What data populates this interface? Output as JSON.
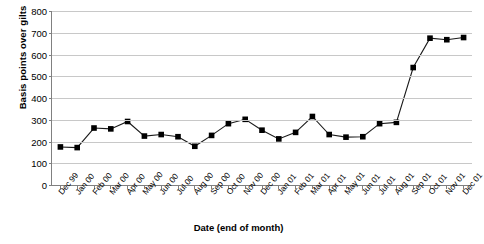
{
  "chart_data": {
    "type": "line",
    "title": "",
    "xlabel": "Date (end of month)",
    "ylabel": "Basis points over gilts",
    "ylim": [
      0,
      800
    ],
    "yticks": [
      0,
      100,
      200,
      300,
      400,
      500,
      600,
      700,
      800
    ],
    "grid": true,
    "legend": "none",
    "marker": "filled-square",
    "line_color": "#000000",
    "marker_color": "#000000",
    "gridline_color": "#c8c8c8",
    "axis_color": "#808080",
    "categories": [
      "Dec 99",
      "Jan 00",
      "Feb 00",
      "Mar 00",
      "Apr 00",
      "May 00",
      "Jun 00",
      "Jul 00",
      "Aug 00",
      "Sep 00",
      "Oct 00",
      "Nov 00",
      "Dec 00",
      "Jan 01",
      "Feb 01",
      "Mar 01",
      "Apr 01",
      "May 01",
      "Jun 01",
      "Jul 01",
      "Aug 01",
      "Sep 01",
      "Oct 01",
      "Nov 01",
      "Dec 01"
    ],
    "values": [
      175,
      172,
      262,
      258,
      292,
      225,
      232,
      222,
      178,
      228,
      282,
      302,
      252,
      212,
      242,
      315,
      232,
      220,
      222,
      282,
      288,
      540,
      675,
      668,
      678
    ]
  }
}
